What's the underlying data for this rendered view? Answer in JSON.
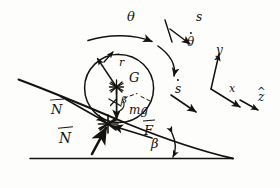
{
  "figure": {
    "kind": "hand-drawn-physics-free-body-diagram",
    "ink_color": "#14120f",
    "paper_color": "#fdfdfc"
  },
  "labels": {
    "theta": "θ",
    "theta_dot": "θ",
    "s": "s",
    "s_dot": "s",
    "r": "r",
    "G": "G",
    "mg": "mg",
    "beta": "β",
    "F_vec": "F",
    "N_vec_upper": "N",
    "N_vec_lower": "N",
    "axis_x": "x",
    "axis_y": "y",
    "axis_z": "z"
  },
  "annotations": {
    "theta_note": "angular position of the disk, curved arrow clockwise over the top",
    "theta_dot_note": "angular rate, curved arrow on the right of the disk",
    "s_note": "arc-length / travel coordinate along the incline",
    "s_dot_note": "speed along the incline",
    "r_note": "radius arrow from centre G to the rim",
    "G_note": "centre of mass of the disk",
    "mg_note": "weight vector pointing vertically downward from G",
    "beta_note": "incline angle measured from the horizontal ground line",
    "F_note": "friction force at the contact point, up the slope",
    "N_note": "normal force at the contact point, perpendicular to the incline",
    "axes_note": "body / inertial frame triad drawn to the right: y up-left, x down-right, z-hat further down-right"
  },
  "geometry": {
    "incline_start": [
      18,
      80
    ],
    "incline_end": [
      232,
      158
    ],
    "ground_start": [
      30,
      158
    ],
    "ground_end": [
      232,
      158
    ],
    "contact_point": [
      108,
      124
    ],
    "disk_center": [
      119,
      88
    ],
    "disk_radius": 34
  }
}
